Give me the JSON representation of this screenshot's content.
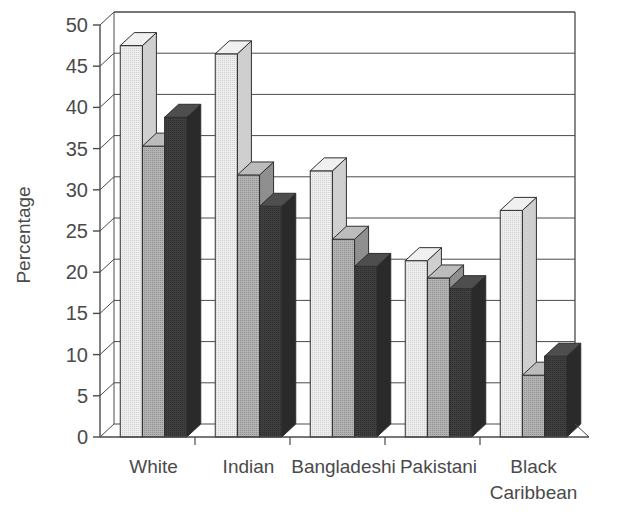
{
  "chart_data": {
    "type": "bar",
    "title": "",
    "subtitle": "",
    "xlabel": "",
    "ylabel": "Percentage",
    "ylim": [
      0,
      50
    ],
    "ytick_step": 5,
    "yticks": [
      "0",
      "5",
      "10",
      "15",
      "20",
      "25",
      "30",
      "35",
      "40",
      "45",
      "50"
    ],
    "grid": true,
    "legend": "none",
    "style": "3d-grouped-bar",
    "categories": [
      "White",
      "Indian",
      "Bangladeshi",
      "Pakistani",
      "Black Caribbean"
    ],
    "category_label_lines": [
      [
        "White"
      ],
      [
        "Indian"
      ],
      [
        "Bangladeshi"
      ],
      [
        "Pakistani"
      ],
      [
        "Black",
        "Caribbean"
      ]
    ],
    "series": [
      {
        "name": "series-1",
        "color": "#e3e3e3",
        "side_color": "#cfcfcf",
        "top_color": "#f0f0f0",
        "values": [
          47.5,
          46.5,
          32.3,
          21.4,
          27.5
        ]
      },
      {
        "name": "series-2",
        "color": "#a8a8a8",
        "side_color": "#8f8f8f",
        "top_color": "#bcbcbc",
        "values": [
          35.3,
          31.8,
          24.0,
          19.3,
          7.5
        ]
      },
      {
        "name": "series-3",
        "color": "#3c3c3c",
        "side_color": "#2a2a2a",
        "top_color": "#4e4e4e",
        "values": [
          38.8,
          28.0,
          20.7,
          18.0,
          9.8
        ]
      }
    ]
  },
  "axis": {
    "y_title": "Percentage",
    "stroke": "#4a4a4a"
  }
}
